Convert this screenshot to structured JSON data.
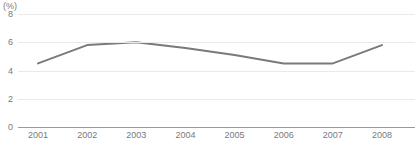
{
  "chart_data": {
    "type": "line",
    "title": "",
    "subtitle": "",
    "xlabel": "",
    "ylabel": "",
    "unit_label": "(%)",
    "categories": [
      "2001",
      "2002",
      "2003",
      "2004",
      "2005",
      "2006",
      "2007",
      "2008"
    ],
    "values": [
      4.5,
      5.8,
      6.0,
      5.6,
      5.1,
      4.5,
      4.5,
      5.8
    ],
    "series": [
      {
        "name": "",
        "values": [
          4.5,
          5.8,
          6.0,
          5.6,
          5.1,
          4.5,
          4.5,
          5.8
        ],
        "color": "#7a7a7a"
      }
    ],
    "ylim": [
      0,
      8
    ],
    "yticks": [
      0,
      2,
      4,
      6,
      8
    ],
    "ytick_labels": [
      "0",
      "2",
      "4",
      "6",
      "8"
    ],
    "grid": true,
    "grid_color": "#e9e9e9",
    "axis_color": "#9a9a9a",
    "legend": false,
    "legend_position": "none",
    "markers": false,
    "line_width": 2
  },
  "footnote": {
    "text": ""
  }
}
